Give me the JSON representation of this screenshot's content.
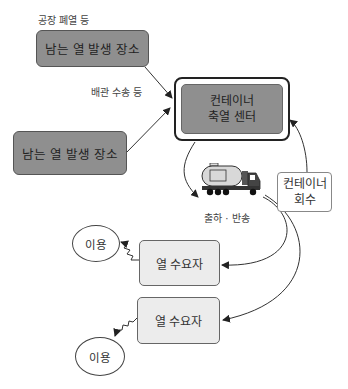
{
  "diagram": {
    "labels": {
      "factory_waste_heat": "공장 폐열 등",
      "pipe_transport": "배관 수송 등",
      "shipping_return": "출하 · 반송"
    },
    "sources": [
      {
        "label": "남는 열 발생 장소"
      },
      {
        "label": "남는 열 발생 장소"
      }
    ],
    "center": {
      "line1": "컨테이너",
      "line2": "축열 센터"
    },
    "container_return": {
      "line1": "컨테이너",
      "line2": "회수"
    },
    "consumers": [
      {
        "label": "열 수요자"
      },
      {
        "label": "열 수요자"
      }
    ],
    "usage": [
      {
        "label": "이용"
      },
      {
        "label": "이용"
      }
    ],
    "icons": [
      "tank-truck-icon"
    ],
    "colors": {
      "source_fill": "#8f8f8f",
      "center_fill": "#8f8f8f",
      "consumer_fill": "#ececec",
      "line": "#333333"
    }
  }
}
